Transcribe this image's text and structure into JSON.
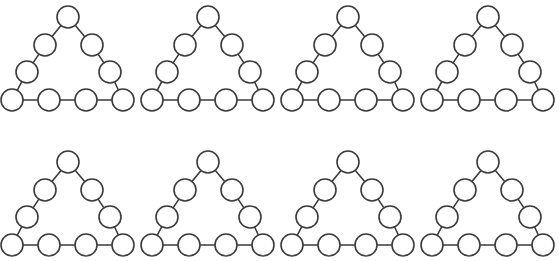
{
  "figure": {
    "background_color": "#ffffff",
    "node_fill_color": "#ffffff",
    "node_stroke_color": "#3b3b3b",
    "edge_stroke_color": "#3b3b3b",
    "stroke_width": 1.6,
    "node_radius": 11,
    "canvas": {
      "width": 559,
      "height": 261
    },
    "grid": {
      "rows": 2,
      "columns": 4,
      "total_panels": 8,
      "column_spacing": 140,
      "row_spacing": 145,
      "origins": [
        {
          "x": 0,
          "y": 0
        },
        {
          "x": 140,
          "y": 0
        },
        {
          "x": 280,
          "y": 0
        },
        {
          "x": 420,
          "y": 0
        },
        {
          "x": 0,
          "y": 145
        },
        {
          "x": 140,
          "y": 145
        },
        {
          "x": 280,
          "y": 145
        },
        {
          "x": 420,
          "y": 145
        }
      ]
    },
    "panel_template": {
      "node_count": 9,
      "edge_count": 9,
      "side_nodes_per_edge": 4,
      "nodes": [
        {
          "id": "apex",
          "label": "1",
          "x": 68,
          "y": 17
        },
        {
          "id": "left-upper",
          "label": "2",
          "x": 45,
          "y": 45
        },
        {
          "id": "right-upper",
          "label": "3",
          "x": 92,
          "y": 45
        },
        {
          "id": "left-lower",
          "label": "4",
          "x": 27,
          "y": 72
        },
        {
          "id": "right-lower",
          "label": "5",
          "x": 110,
          "y": 72
        },
        {
          "id": "bottom-1",
          "label": "6",
          "x": 12,
          "y": 100
        },
        {
          "id": "bottom-2",
          "label": "7",
          "x": 49,
          "y": 100
        },
        {
          "id": "bottom-3",
          "label": "8",
          "x": 86,
          "y": 100
        },
        {
          "id": "bottom-4",
          "label": "9",
          "x": 123,
          "y": 100
        }
      ],
      "edges": [
        {
          "from": "apex",
          "to": "left-upper"
        },
        {
          "from": "left-upper",
          "to": "left-lower"
        },
        {
          "from": "left-lower",
          "to": "bottom-1"
        },
        {
          "from": "apex",
          "to": "right-upper"
        },
        {
          "from": "right-upper",
          "to": "right-lower"
        },
        {
          "from": "right-lower",
          "to": "bottom-4"
        },
        {
          "from": "bottom-1",
          "to": "bottom-2"
        },
        {
          "from": "bottom-2",
          "to": "bottom-3"
        },
        {
          "from": "bottom-3",
          "to": "bottom-4"
        }
      ]
    }
  }
}
